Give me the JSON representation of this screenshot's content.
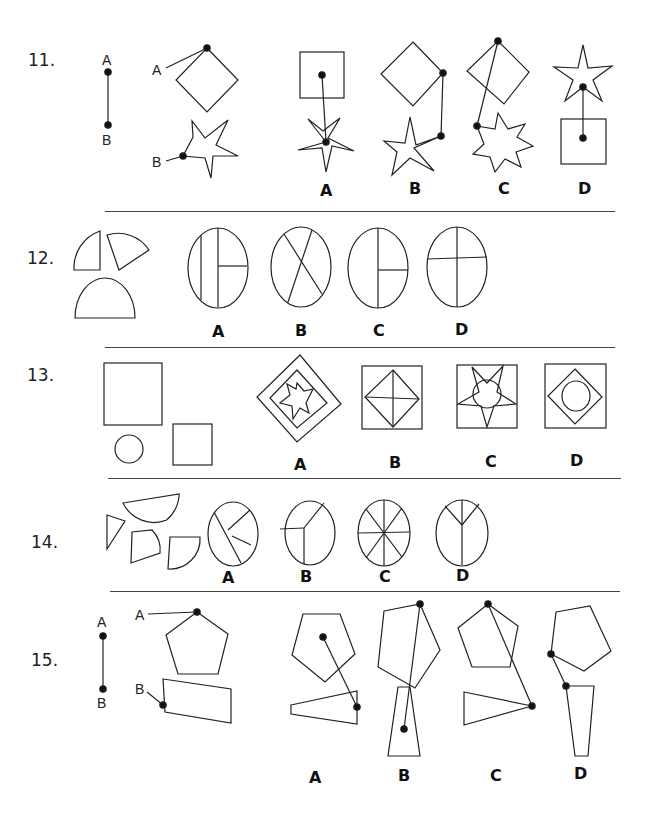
{
  "questions": [
    {
      "number": "11.",
      "key_labels": [
        "A",
        "B"
      ],
      "options": [
        "A",
        "B",
        "C",
        "D"
      ]
    },
    {
      "number": "12.",
      "options": [
        "A",
        "B",
        "C",
        "D"
      ]
    },
    {
      "number": "13.",
      "options": [
        "A",
        "B",
        "C",
        "D"
      ]
    },
    {
      "number": "14.",
      "options": [
        "A",
        "B",
        "C",
        "D"
      ]
    },
    {
      "number": "15.",
      "key_labels": [
        "A",
        "B"
      ],
      "options": [
        "A",
        "B",
        "C",
        "D"
      ]
    }
  ],
  "colors": {
    "stroke": "#222222",
    "background": "#ffffff"
  }
}
